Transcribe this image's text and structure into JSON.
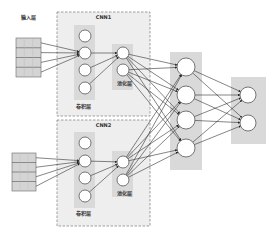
{
  "diagram": {
    "title": "",
    "colors": {
      "cnn_box_fill": "#eeeeee",
      "cnn_box_border": "#888888",
      "layer_band": "#d9d9d9",
      "node_fill": "#ffffff",
      "node_stroke": "#555555",
      "edge": "#333333",
      "input_fill": "#d4d4d4"
    },
    "input_layer": {
      "label": "输入层",
      "blocks": [
        {
          "x": 16,
          "y": 38,
          "w": 25,
          "h": 39,
          "rows": 4
        },
        {
          "x": 12,
          "y": 153,
          "w": 24,
          "h": 38,
          "rows": 4
        }
      ]
    },
    "cnn_modules": [
      {
        "name": "CNN1",
        "box": {
          "x": 57,
          "y": 12,
          "w": 93,
          "h": 104
        },
        "conv": {
          "label": "卷积层",
          "band": {
            "x": 74,
            "y": 25,
            "w": 21,
            "h": 75
          },
          "nodes": [
            [
              85,
              36
            ],
            [
              85,
              53
            ],
            [
              85,
              70
            ],
            [
              85,
              88
            ]
          ],
          "label_pos": [
            76,
            108
          ]
        },
        "pool": {
          "label": "池化层",
          "band": {
            "x": 112,
            "y": 44,
            "w": 21,
            "h": 46
          },
          "nodes": [
            [
              123,
              53
            ],
            [
              123,
              70
            ]
          ],
          "label_pos": [
            117,
            85
          ]
        }
      },
      {
        "name": "CNN2",
        "box": {
          "x": 57,
          "y": 120,
          "w": 93,
          "h": 106
        },
        "conv": {
          "label": "卷积层",
          "band": {
            "x": 74,
            "y": 132,
            "w": 21,
            "h": 76
          },
          "nodes": [
            [
              85,
              143
            ],
            [
              85,
              161
            ],
            [
              85,
              178
            ],
            [
              85,
              196
            ]
          ],
          "label_pos": [
            76,
            215
          ]
        },
        "pool": {
          "label": "池化层",
          "band": {
            "x": 112,
            "y": 151,
            "w": 21,
            "h": 46
          },
          "nodes": [
            [
              123,
              162
            ],
            [
              123,
              180
            ]
          ],
          "label_pos": [
            117,
            195
          ]
        }
      }
    ],
    "hidden_layer": {
      "band": {
        "x": 170,
        "y": 52,
        "w": 32,
        "h": 118
      },
      "nodes": [
        [
          186,
          67
        ],
        [
          186,
          95
        ],
        [
          186,
          120
        ],
        [
          186,
          148
        ]
      ],
      "radius": 9
    },
    "output_layer": {
      "band": {
        "x": 231,
        "y": 77,
        "w": 35,
        "h": 67
      },
      "nodes": [
        [
          248,
          95
        ],
        [
          248,
          123
        ]
      ],
      "radius": 8
    }
  }
}
